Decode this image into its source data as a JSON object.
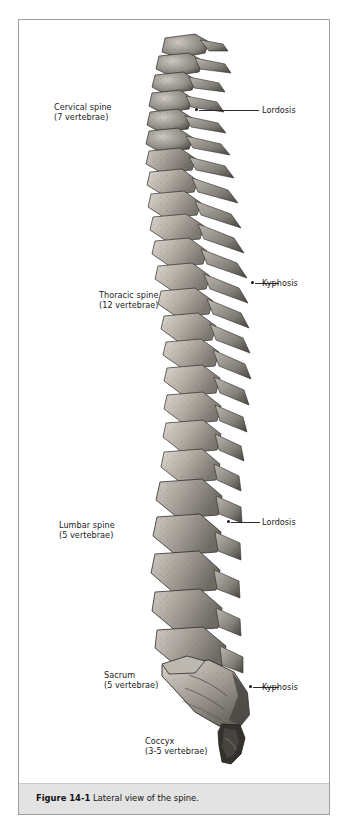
{
  "figure": {
    "caption_prefix": "Figure 14-1",
    "caption_text": "Lateral view of the spine."
  },
  "labels": {
    "cervical": {
      "line1": "Cervical spine",
      "line2": "(7 vertebrae)"
    },
    "thoracic": {
      "line1": "Thoracic spine",
      "line2": "(12 vertebrae)"
    },
    "lumbar": {
      "line1": "Lumbar spine",
      "line2": "(5 vertebrae)"
    },
    "sacrum": {
      "line1": "Sacrum",
      "line2": "(5 vertebrae)"
    },
    "coccyx": {
      "line1": "Coccyx",
      "line2": "(3-5 vertebrae)"
    },
    "curve_cervical": "Lordosis",
    "curve_thoracic": "Kyphosis",
    "curve_lumbar": "Lordosis",
    "curve_sacral": "Kyphosis"
  },
  "colors": {
    "frame_border": "#9aa0a6",
    "caption_background": "#e3e3e3",
    "text": "#1a1a1a",
    "leader_line": "#2b2b2b",
    "bone_light": "#d8d4ce",
    "bone_mid": "#9b968f",
    "bone_dark": "#4a4742",
    "background": "#ffffff"
  }
}
